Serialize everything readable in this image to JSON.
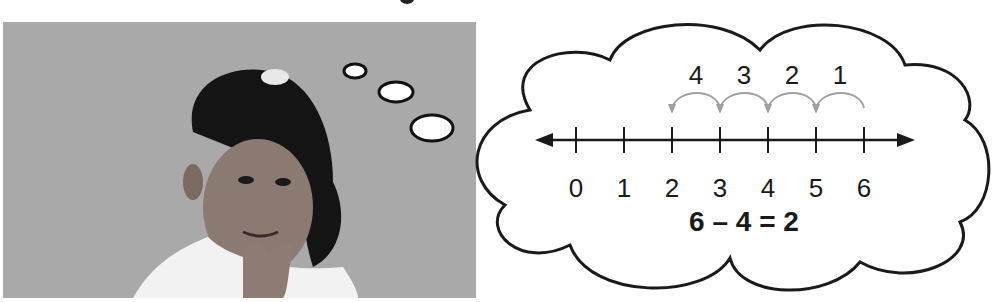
{
  "illustration": {
    "photo": {
      "subject": "girl thinking with hand on chin",
      "background_color": "#a9a9a9"
    },
    "thought_bubbles": 3,
    "cloud": {
      "number_line": {
        "ticks": [
          "0",
          "1",
          "2",
          "3",
          "4",
          "5",
          "6"
        ],
        "jump_labels": [
          "4",
          "3",
          "2",
          "1"
        ],
        "jumps": [
          {
            "from": 6,
            "to": 5,
            "label": "1"
          },
          {
            "from": 5,
            "to": 4,
            "label": "2"
          },
          {
            "from": 4,
            "to": 3,
            "label": "3"
          },
          {
            "from": 3,
            "to": 2,
            "label": "4"
          }
        ],
        "arrow_color": "#a0a0a0",
        "line_color": "#1a1a1a"
      },
      "equation": "6 – 4 = 2"
    }
  }
}
